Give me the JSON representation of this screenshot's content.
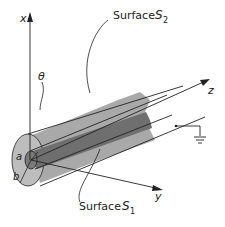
{
  "figure": {
    "labels": {
      "surface_top": "Surface",
      "surface_top_symbol": "S",
      "surface_top_sub": "2",
      "surface_bottom": "Surface",
      "surface_bottom_symbol": "S",
      "surface_bottom_sub": "1",
      "axis_x": "x",
      "axis_y": "y",
      "axis_z": "z",
      "theta": "θ",
      "radius_inner": "a",
      "radius_outer": "b"
    },
    "colors": {
      "outer_shell": "#a9a9a9",
      "outer_shell_end": "#bdbdbd",
      "inner_conductor": "#6f6f6f",
      "inner_end": "#7a7a7a",
      "line": "#222222"
    },
    "ground_symbol": "ground-icon"
  }
}
